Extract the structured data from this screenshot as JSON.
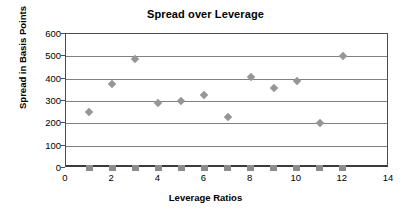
{
  "chart_data": {
    "type": "scatter",
    "title": "Spread over Leverage",
    "xlabel": "Leverage Ratios",
    "ylabel": "Spread in Basis Points",
    "xlim": [
      0,
      14
    ],
    "ylim": [
      0,
      600
    ],
    "xticks": [
      0,
      2,
      4,
      6,
      8,
      10,
      12,
      14
    ],
    "yticks": [
      0,
      100,
      200,
      300,
      400,
      500,
      600
    ],
    "grid": "horizontal",
    "legend": "none",
    "series": [
      {
        "name": "spread",
        "marker": "diamond",
        "color": "#969696",
        "points": [
          {
            "x": 1,
            "y": 250
          },
          {
            "x": 2,
            "y": 375
          },
          {
            "x": 3,
            "y": 490
          },
          {
            "x": 4,
            "y": 293
          },
          {
            "x": 5,
            "y": 302
          },
          {
            "x": 6,
            "y": 328
          },
          {
            "x": 7,
            "y": 228
          },
          {
            "x": 8,
            "y": 408
          },
          {
            "x": 9,
            "y": 357
          },
          {
            "x": 10,
            "y": 388
          },
          {
            "x": 11,
            "y": 203
          },
          {
            "x": 12,
            "y": 503
          }
        ]
      },
      {
        "name": "baseline",
        "marker": "square",
        "color": "#8c8c8c",
        "points": [
          {
            "x": 1,
            "y": 0
          },
          {
            "x": 2,
            "y": 0
          },
          {
            "x": 3,
            "y": 0
          },
          {
            "x": 4,
            "y": 0
          },
          {
            "x": 5,
            "y": 0
          },
          {
            "x": 6,
            "y": 0
          },
          {
            "x": 7,
            "y": 0
          },
          {
            "x": 8,
            "y": 0
          },
          {
            "x": 9,
            "y": 0
          },
          {
            "x": 10,
            "y": 0
          },
          {
            "x": 11,
            "y": 0
          },
          {
            "x": 12,
            "y": 0
          }
        ]
      }
    ]
  }
}
